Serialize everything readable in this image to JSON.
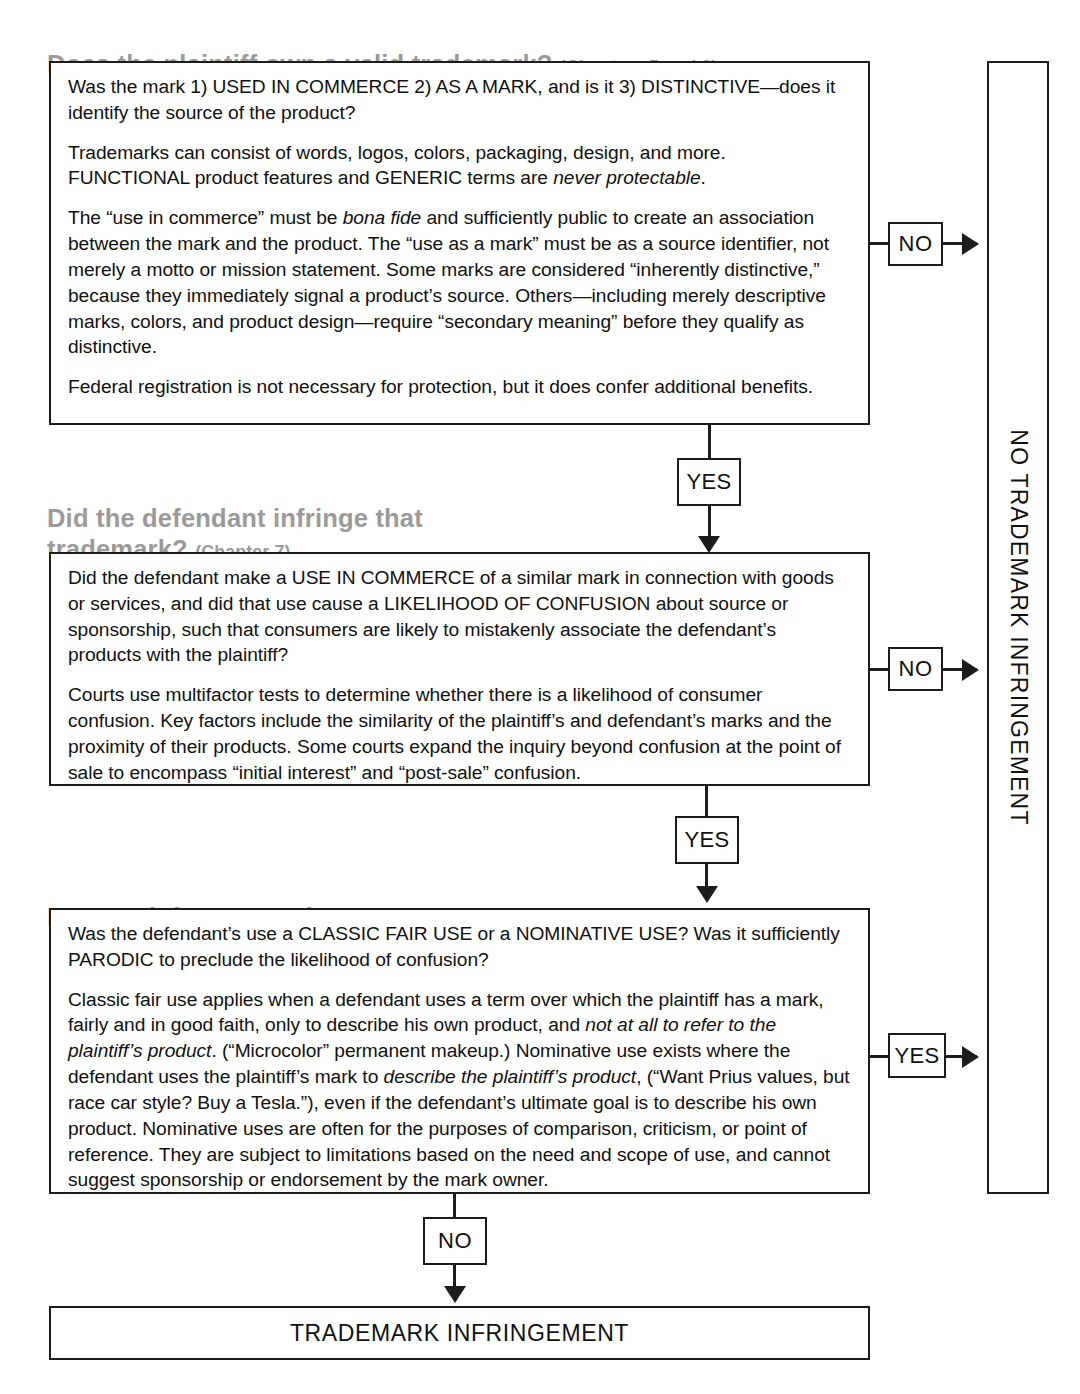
{
  "flowchart": {
    "title_text": "Trademark infringement analysis flowchart",
    "sections": [
      {
        "heading": "Does the plaintiff own a valid trademark? ",
        "chapter": "(Chapters 5 and 6)",
        "paragraphs": [
          "Was the mark 1) USED IN COMMERCE 2) AS A MARK, and is it 3) DISTINCTIVE—does it identify the source of the product?",
          "Trademarks can consist of words, logos, colors, packaging, design, and more. FUNCTIONAL product features and GENERIC terms are never protectable.",
          "The “use in commerce” must be bona fide and sufficiently public to create an association between the mark and the product. The “use as a mark” must be as a source identifier, not merely a motto or mission statement. Some marks are considered “inherently distinctive,” because they immediately signal a product’s source. Others—including merely descriptive marks, colors, and product design—require “secondary meaning” before they qualify as distinctive.",
          "Federal registration is not necessary for protection, but it does confer additional benefits."
        ],
        "exit_label": "NO",
        "continue_label": "YES"
      },
      {
        "heading": "Did the defendant infringe that\ntrademark? ",
        "chapter": "(Chapter 7)",
        "paragraphs": [
          "Did the defendant make a USE IN COMMERCE of a similar mark in connection with goods or services, and did that use cause a LIKELIHOOD OF CONFUSION about source or sponsorship, such that consumers are likely to mistakenly associate the defendant’s products with the plaintiff?",
          "Courts use multifactor tests to determine whether there is a likelihood of consumer confusion. Key factors include the similarity of the plaintiff’s and defendant’s marks and the proximity of their products. Some courts expand the inquiry beyond confusion at the point of sale to encompass “initial interest” and “post-sale” confusion."
        ],
        "exit_label": "NO",
        "continue_label": "YES"
      },
      {
        "heading": "Do any defenses apply? ",
        "chapter": "(Chapter 8)",
        "paragraphs": [
          "Was the defendant’s use a CLASSIC FAIR USE or a NOMINATIVE USE? Was it sufficiently PARODIC to preclude the likelihood of confusion?",
          "Classic fair use applies when a defendant uses a term over which the plaintiff has a mark, fairly and in good faith, only to describe his own product, and not at all to refer to the plaintiff’s product. (“Microcolor” permanent makeup.) Nominative use exists where the defendant uses the plaintiff’s mark to describe the plaintiff’s product, (“Want Prius values, but race car style? Buy a Tesla.”), even if the defendant’s ultimate goal is to describe his own product. Nominative uses are often for the purposes of comparison, criticism, or point of reference. They are subject to limitations based on the need and scope of use, and cannot suggest sponsorship or endorsement by the mark owner."
        ],
        "exit_label": "YES",
        "continue_label": "NO"
      }
    ],
    "outcome_no_infringement": "NO TRADEMARK INFRINGEMENT",
    "outcome_infringement": "TRADEMARK INFRINGEMENT",
    "colors": {
      "heading": "#9a9a9a",
      "stroke": "#1c1c1c",
      "body_text": "#101010",
      "background": "#ffffff"
    }
  }
}
